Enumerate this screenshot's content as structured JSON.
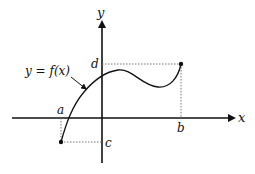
{
  "diagram": {
    "type": "function-graph",
    "axes": {
      "x_label": "x",
      "y_label": "y"
    },
    "function_label": "y = f(x)",
    "points": {
      "a": "a",
      "b": "b",
      "c": "c",
      "d": "d"
    },
    "colors": {
      "ink": "#111111",
      "dotted": "#777777"
    }
  }
}
